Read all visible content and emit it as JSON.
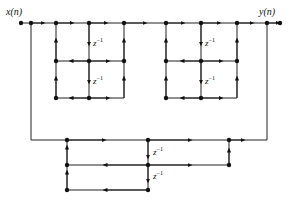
{
  "diagram": {
    "input_label": "x(n)",
    "output_label": "y(n)",
    "delay_label": "z",
    "delay_exponent": "−1",
    "colors": {
      "line": "#222222",
      "node": "#111111",
      "background": "#ffffff"
    },
    "nodes": [
      {
        "id": "in",
        "x": 21,
        "y": 23
      },
      {
        "id": "split",
        "x": 31,
        "y": 23
      },
      {
        "id": "a1",
        "x": 56,
        "y": 23
      },
      {
        "id": "a2",
        "x": 89,
        "y": 23
      },
      {
        "id": "a3",
        "x": 124,
        "y": 23
      },
      {
        "id": "a4",
        "x": 56,
        "y": 61
      },
      {
        "id": "a5",
        "x": 89,
        "y": 61
      },
      {
        "id": "a6",
        "x": 124,
        "y": 61
      },
      {
        "id": "a7",
        "x": 56,
        "y": 98
      },
      {
        "id": "a8",
        "x": 89,
        "y": 98
      },
      {
        "id": "b1",
        "x": 166,
        "y": 23
      },
      {
        "id": "b2",
        "x": 201,
        "y": 23
      },
      {
        "id": "b3",
        "x": 237,
        "y": 23
      },
      {
        "id": "b4",
        "x": 166,
        "y": 61
      },
      {
        "id": "b5",
        "x": 201,
        "y": 61
      },
      {
        "id": "b6",
        "x": 237,
        "y": 61
      },
      {
        "id": "b7",
        "x": 166,
        "y": 98
      },
      {
        "id": "b8",
        "x": 201,
        "y": 98
      },
      {
        "id": "sum",
        "x": 267,
        "y": 23
      },
      {
        "id": "out",
        "x": 280,
        "y": 23
      },
      {
        "id": "c1",
        "x": 67,
        "y": 140
      },
      {
        "id": "c2",
        "x": 148,
        "y": 140
      },
      {
        "id": "c3",
        "x": 229,
        "y": 140
      },
      {
        "id": "c4",
        "x": 67,
        "y": 165
      },
      {
        "id": "c5",
        "x": 148,
        "y": 165
      },
      {
        "id": "c6",
        "x": 229,
        "y": 165
      },
      {
        "id": "c7",
        "x": 67,
        "y": 190
      },
      {
        "id": "c8",
        "x": 148,
        "y": 190
      }
    ],
    "delays": [
      {
        "section": "lattice-1",
        "x": 93,
        "y": 44
      },
      {
        "section": "lattice-1",
        "x": 93,
        "y": 82
      },
      {
        "section": "lattice-2",
        "x": 205,
        "y": 44
      },
      {
        "section": "lattice-2",
        "x": 205,
        "y": 82
      },
      {
        "section": "bottom",
        "x": 153,
        "y": 153
      },
      {
        "section": "bottom",
        "x": 153,
        "y": 177
      }
    ]
  }
}
